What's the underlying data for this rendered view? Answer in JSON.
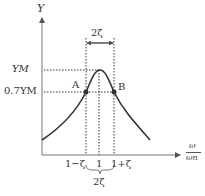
{
  "diagram": {
    "title": "",
    "y_axis_label": "Y",
    "x_axis_label_num": "ω",
    "x_axis_label_den": "ωn",
    "ym_label": "YM",
    "y07_label": "0.7YM",
    "point_a": "A",
    "point_b": "B",
    "top_width_label": "2ζ",
    "bottom_width_label": "2ζ",
    "ticks": [
      "1−ζ",
      "1",
      "1+ζ"
    ],
    "colors": {
      "line": "#333333",
      "background": "#ffffff"
    }
  }
}
